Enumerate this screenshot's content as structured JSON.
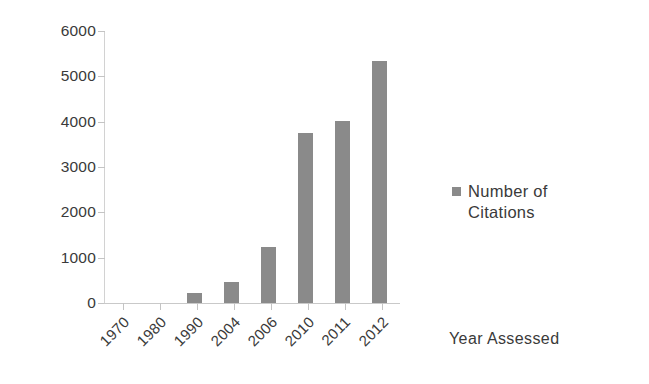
{
  "chart_data": {
    "type": "bar",
    "title": "",
    "subtitle": "",
    "xlabel": "Year Assessed",
    "ylabel": "",
    "categories": [
      "1970",
      "1980",
      "1990",
      "2004",
      "2006",
      "2010",
      "2011",
      "2012"
    ],
    "values": [
      0,
      0,
      220,
      460,
      1230,
      3750,
      4020,
      5340
    ],
    "series": [
      {
        "name": "Number of Citations",
        "values": [
          0,
          0,
          220,
          460,
          1230,
          3750,
          4020,
          5340
        ]
      }
    ],
    "ylim": [
      0,
      6000
    ],
    "y_ticks": [
      "0",
      "1000",
      "2000",
      "3000",
      "4000",
      "5000",
      "6000"
    ],
    "y_tick_values": [
      0,
      1000,
      2000,
      3000,
      4000,
      5000,
      6000
    ],
    "grid": false,
    "legend_position": "right",
    "legend": [
      "Number of Citations"
    ],
    "bar_color": "#8a8a8a",
    "axis_color": "#c9c9c9",
    "text_color": "#3a3a3a"
  },
  "legend": {
    "entries": [
      {
        "label_line1": "Number of",
        "label_line2": "Citations",
        "swatch_color": "#8a8a8a"
      }
    ]
  },
  "axes": {
    "x_title": "Year Assessed"
  }
}
